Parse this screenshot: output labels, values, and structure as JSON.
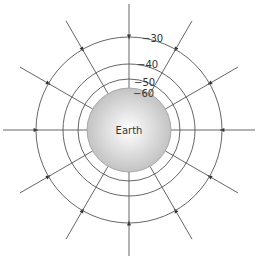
{
  "diagram": {
    "center": {
      "x": 129,
      "y": 130
    },
    "earth": {
      "label": "Earth",
      "radius": 42,
      "fill_light": "#ffffff",
      "fill_dark": "#bdbdbd",
      "stroke": "#9a9a9a"
    },
    "equipotentials": [
      {
        "label": "−30",
        "radius": 93,
        "label_x": 142,
        "label_y": 42
      },
      {
        "label": "−40",
        "radius": 66,
        "label_x": 137,
        "label_y": 68
      },
      {
        "label": "−50",
        "radius": 51,
        "label_x": 134,
        "label_y": 86
      },
      {
        "label": "−60",
        "radius": 42,
        "label_x": 133,
        "label_y": 97
      }
    ],
    "field_lines": {
      "count": 12,
      "outer_radius": 126,
      "arrow_radius": 93,
      "direction": "inward",
      "angles_deg": [
        0,
        30,
        60,
        90,
        120,
        150,
        180,
        210,
        240,
        270,
        300,
        330
      ]
    },
    "line_color": "#555555"
  }
}
